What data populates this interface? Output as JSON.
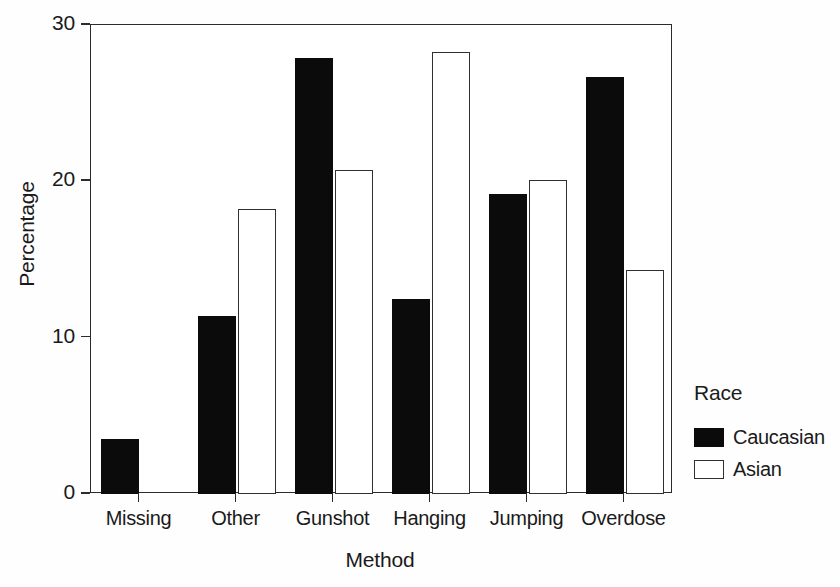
{
  "chart_data": {
    "type": "bar",
    "title": "",
    "xlabel": "Method",
    "ylabel": "Percentage",
    "categories": [
      "Missing",
      "Other",
      "Gunshot",
      "Hanging",
      "Jumping",
      "Overdose"
    ],
    "series": [
      {
        "name": "Caucasian",
        "color": "#0b0b0b",
        "fill": "solid-black",
        "values": [
          3.5,
          11.4,
          27.9,
          12.5,
          19.2,
          26.7
        ]
      },
      {
        "name": "Asian",
        "color": "#ffffff",
        "fill": "white-outlined",
        "values": [
          0,
          18.2,
          20.7,
          28.3,
          20.1,
          14.3
        ]
      }
    ],
    "ylim": [
      0,
      30
    ],
    "yticks": [
      0,
      10,
      20,
      30
    ],
    "ytick_labels": [
      "0",
      "10",
      "20",
      "30"
    ],
    "grid": false,
    "legend": {
      "title": "Race",
      "position": "right",
      "entries": [
        "Caucasian",
        "Asian"
      ]
    }
  },
  "axes": {
    "y_title": "Percentage",
    "x_title": "Method"
  }
}
